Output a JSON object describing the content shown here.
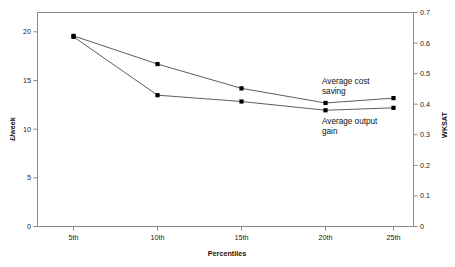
{
  "chart_data": {
    "type": "line",
    "title": "",
    "subtitle": "",
    "xlabel": "Percentiles",
    "ylabel": "£/week",
    "y2label": "WKSAT",
    "categories": [
      "5th",
      "10th",
      "15th",
      "20th",
      "25th"
    ],
    "x_tick_labels": [
      "5th",
      "10th",
      "15th",
      "20th",
      "25th"
    ],
    "y_tick_labels": [
      "0",
      "5",
      "10",
      "15",
      "20"
    ],
    "y_ticks": [
      0,
      5,
      10,
      15,
      20
    ],
    "ylim": [
      0,
      22
    ],
    "y2_tick_labels": [
      "0",
      "0.1",
      "0.2",
      "0.3",
      "0.4",
      "0.5",
      "0.6",
      "0.7"
    ],
    "y2_ticks": [
      0,
      0.1,
      0.2,
      0.3,
      0.4,
      0.5,
      0.6,
      0.7
    ],
    "y2lim": [
      0,
      0.7
    ],
    "grid": false,
    "legend_position": "inline-annotations",
    "series": [
      {
        "name": "Average cost saving",
        "axis": "left",
        "values": [
          19.6,
          16.7,
          14.2,
          12.7,
          13.2
        ],
        "marker": "square",
        "color": "#000000"
      },
      {
        "name": "Average output gain",
        "axis": "left",
        "values": [
          19.5,
          13.5,
          12.85,
          11.95,
          12.2
        ],
        "marker": "square",
        "color": "#000000"
      }
    ],
    "annotations": [
      {
        "id": "annot-cost-saving",
        "line1": "Average cost",
        "line2": "saving"
      },
      {
        "id": "annot-output-gain",
        "line1": "Average output",
        "line2": "gain"
      }
    ]
  },
  "axes": {
    "left_title": "£/week",
    "right_title": "WKSAT",
    "bottom_title": "Percentiles"
  }
}
